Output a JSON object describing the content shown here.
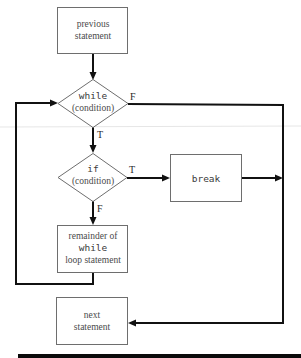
{
  "diagram": {
    "type": "flowchart",
    "nodes": {
      "previous": {
        "shape": "process",
        "lines": [
          "previous",
          "statement"
        ]
      },
      "while_cond": {
        "shape": "decision",
        "keyword": "while",
        "condition": "(condition)"
      },
      "if_cond": {
        "shape": "decision",
        "keyword": "if",
        "condition": "(condition)"
      },
      "break_box": {
        "shape": "process",
        "keyword": "break"
      },
      "remainder": {
        "shape": "process",
        "line1": "remainder of",
        "keyword": "while",
        "line3": "loop statement"
      },
      "next": {
        "shape": "process",
        "lines": [
          "next",
          "statement"
        ]
      }
    },
    "edge_labels": {
      "while_false": "F",
      "while_true": "T",
      "if_true": "T",
      "if_false": "F"
    },
    "edges": [
      {
        "from": "previous",
        "to": "while_cond",
        "label": ""
      },
      {
        "from": "while_cond",
        "to": "if_cond",
        "label": "T"
      },
      {
        "from": "while_cond",
        "to": "next",
        "label": "F"
      },
      {
        "from": "if_cond",
        "to": "break_box",
        "label": "T"
      },
      {
        "from": "if_cond",
        "to": "remainder",
        "label": "F"
      },
      {
        "from": "break_box",
        "to": "next",
        "label": ""
      },
      {
        "from": "remainder",
        "to": "while_cond",
        "label": ""
      }
    ],
    "colors": {
      "line": "#111111",
      "box_border": "#6e6e6e",
      "text": "#4a4a4a",
      "footer_bar": "#0a0a0a"
    }
  }
}
